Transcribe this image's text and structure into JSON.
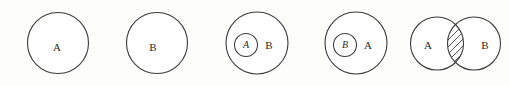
{
  "figure": {
    "background_color": "#fdfdfc",
    "stroke_color": "#3b3b3b",
    "text_color": "#2a2a2a",
    "hatch_color": "#3f3f3f",
    "panels": [
      {
        "id": "panel-1",
        "name": "set-a-alone",
        "description": "single circle labeled A",
        "labels": {
          "main": "A"
        }
      },
      {
        "id": "panel-2",
        "name": "set-b-alone",
        "description": "single circle labeled B",
        "labels": {
          "main": "B"
        }
      },
      {
        "id": "panel-3",
        "name": "a-subset-of-b",
        "description": "small circle A inside larger circle B",
        "labels": {
          "inner": "A",
          "outer": "B"
        }
      },
      {
        "id": "panel-4",
        "name": "b-subset-of-a",
        "description": "small circle B inside larger circle A",
        "labels": {
          "inner": "B",
          "outer": "A"
        }
      },
      {
        "id": "panel-5",
        "name": "a-intersect-b",
        "description": "two overlapping circles A and B with hatched intersection",
        "labels": {
          "left": "A",
          "right": "B"
        },
        "hatch": {
          "direction": "forward-diagonal",
          "line_count": 7
        }
      }
    ]
  }
}
